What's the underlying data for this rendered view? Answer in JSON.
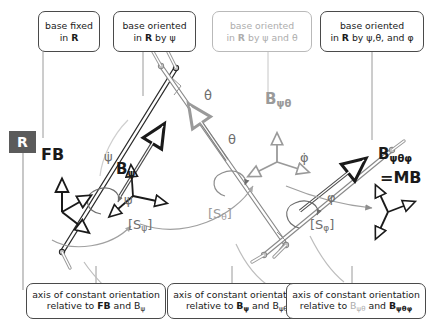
{
  "canvas": {
    "width": 429,
    "height": 325,
    "background": "#ffffff"
  },
  "palette": {
    "ink": "#1a1a1a",
    "box_border": "#4a4a4a",
    "dim_border": "#b9b9b9",
    "dim_text": "#adadad",
    "mid_grey": "#6e6e6e",
    "light_grey": "#9a9a9a",
    "badge_bg": "#5b5b5b",
    "badge_text": "#ffffff",
    "rod_fill": "#ffffff",
    "rod_stroke": "#2b2b2b"
  },
  "top_boxes": [
    {
      "id": "fb-box",
      "dim": false,
      "line1": "base fixed",
      "line2_pre": "in ",
      "line2_bold": "R",
      "line2_post": ""
    },
    {
      "id": "bpsi-box",
      "dim": false,
      "line1": "base oriented",
      "line2_pre": "in ",
      "line2_bold": "R",
      "line2_post": " by ψ"
    },
    {
      "id": "bpsitheta-box",
      "dim": true,
      "line1": "base oriented",
      "line2_pre": "in ",
      "line2_bold": "R",
      "line2_post": " by ψ and θ"
    },
    {
      "id": "bmb-box",
      "dim": false,
      "line1": "base oriented",
      "line2_pre": "in ",
      "line2_bold": "R",
      "line2_post": " by ψ,θ, and φ"
    }
  ],
  "bottom_boxes": [
    {
      "id": "axis-box-1",
      "line1": "axis of constant orientation",
      "pre": "relative to ",
      "a": "FB",
      "a_bold": true,
      "a_sub": "",
      "mid": " and ",
      "b": "B",
      "b_bold": false,
      "b_sub": "ψ"
    },
    {
      "id": "axis-box-2",
      "line1": "axis of constant orientation",
      "pre": "relative to ",
      "a": "B",
      "a_bold": true,
      "a_sub": "ψ",
      "mid": " and ",
      "b": "B",
      "b_bold": false,
      "b_sub": "ψθ"
    },
    {
      "id": "axis-box-3",
      "line1": "axis of constant orientation",
      "pre": "relative to ",
      "a": "B",
      "a_bold": false,
      "a_sub": "ψθ",
      "mid": " and ",
      "b": "B",
      "b_bold": true,
      "b_sub": "ψθφ"
    }
  ],
  "reference_badge": {
    "label": "R"
  },
  "frame_labels": [
    {
      "id": "fb-label",
      "text": "FB",
      "style": "dark"
    },
    {
      "id": "bpsi-label",
      "base": "B",
      "sub": "ψ",
      "style": "dark"
    },
    {
      "id": "bpsitheta-label",
      "base": "B",
      "sub": "ψθ",
      "style": "grey"
    },
    {
      "id": "bmb-label",
      "base": "B",
      "sub": "ψθφ",
      "style": "dark"
    },
    {
      "id": "mb-label",
      "text": "=MB",
      "style": "dark"
    }
  ],
  "angles": [
    {
      "id": "psi",
      "symbol": "ψ",
      "rate_symbol": "ψ̇",
      "style": "mid"
    },
    {
      "id": "theta",
      "symbol": "θ",
      "rate_symbol": "θ̇",
      "style": "mid"
    },
    {
      "id": "phi",
      "symbol": "φ",
      "rate_symbol": "φ̇",
      "style": "mid"
    }
  ],
  "transforms": [
    {
      "id": "s-psi",
      "open": "[S",
      "sub": "ψ",
      "close": "]",
      "style": "mid"
    },
    {
      "id": "s-theta",
      "open": "[S",
      "sub": "θ",
      "close": "]",
      "style": "grey"
    },
    {
      "id": "s-phi",
      "open": "[S",
      "sub": "φ",
      "close": "]",
      "style": "mid"
    }
  ]
}
